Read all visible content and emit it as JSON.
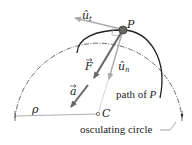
{
  "labels": {
    "ut_hat": "û",
    "ut_sub": "t",
    "P": "P",
    "F": "F",
    "un_hat": "û",
    "un_sub": "n",
    "a": "a",
    "C": "C",
    "rho": "ρ",
    "path": "path of ",
    "path_P": "P",
    "circle": "osculating circle"
  },
  "colors": {
    "path": "#222222",
    "circle": "#444444",
    "force": "#666666",
    "unit_vectors": "#999999",
    "point": "#555555"
  }
}
